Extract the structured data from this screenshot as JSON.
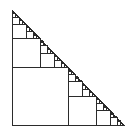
{
  "figure": {
    "title": "Recursive inscribed squares in a right triangle",
    "type": "geometric-diagram",
    "shape": "right-triangle",
    "background_color": "#ffffff",
    "stroke_color": "#2b2b2b",
    "fill_color": "none",
    "stroke_width": 1,
    "canvas": {
      "width": 129,
      "height": 133
    },
    "triangle": {
      "vertices": {
        "apex_top_left": {
          "x": 12,
          "y": 10
        },
        "right_angle_bottom_left": {
          "x": 12,
          "y": 125
        },
        "vertex_bottom_right": {
          "x": 124,
          "y": 125
        }
      },
      "legs": {
        "vertical": 115,
        "horizontal": 112
      },
      "right_angle_at": "bottom-left",
      "hypotenuse": "from apex_top_left to vertex_bottom_right"
    },
    "recursion": {
      "rule": "Each right triangle contains one inscribed square occupying its lower-left corner; the remaining area forms two similar right triangles at half scale, one above the square and one to the right of the square.",
      "depth": 8,
      "scale_factor": 0.5,
      "square_side_ratio": 0.5
    },
    "largest_square": {
      "x": 12,
      "y": 66,
      "side": 56
    },
    "square_sides_sequence": [
      56,
      28,
      14,
      7,
      3.5,
      1.75,
      0.875,
      0.4375
    ]
  }
}
